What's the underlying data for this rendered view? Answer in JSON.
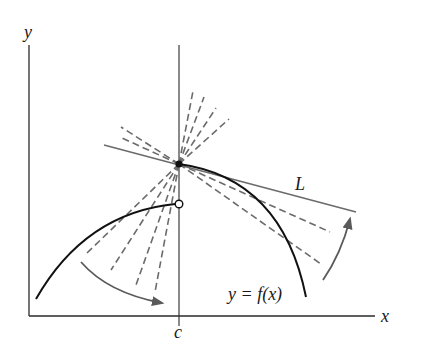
{
  "diagram": {
    "colors": {
      "background": "#ffffff",
      "axis": "#2a2a2a",
      "curve": "#111111",
      "tangent_line": "#6b6b6b",
      "dashed_secants": "#6b6b6b",
      "arrows": "#5a5a5a"
    },
    "labels": {
      "y_axis": "y",
      "x_axis": "x",
      "c_tick": "c",
      "tangent": "L",
      "function": "y = f(x)"
    },
    "points": {
      "filled": {
        "label": "(c, f(c))",
        "x": 179,
        "y": 164
      },
      "open": {
        "label": "left-hand limit (hole)",
        "x": 179,
        "y": 204
      }
    },
    "curves": {
      "left_branch": "M36,299 Q85,213 179,204",
      "right_branch": "M179,164 Q282,178 306,297"
    },
    "tangent_line_L": {
      "x1": 104,
      "y1": 145,
      "x2": 356,
      "y2": 212
    },
    "secants_left_upper": [
      {
        "x1": 179,
        "y1": 164,
        "x2": 121,
        "y2": 127
      },
      {
        "x1": 179,
        "y1": 164,
        "x2": 122,
        "y2": 138
      }
    ],
    "secants_upper_right": [
      {
        "x1": 179,
        "y1": 164,
        "x2": 193,
        "y2": 91
      },
      {
        "x1": 179,
        "y1": 164,
        "x2": 204,
        "y2": 97
      },
      {
        "x1": 179,
        "y1": 164,
        "x2": 216,
        "y2": 108
      },
      {
        "x1": 179,
        "y1": 164,
        "x2": 229,
        "y2": 119
      }
    ],
    "secants_lower_left": [
      {
        "x1": 179,
        "y1": 164,
        "x2": 87,
        "y2": 253
      },
      {
        "x1": 179,
        "y1": 164,
        "x2": 111,
        "y2": 270
      },
      {
        "x1": 179,
        "y1": 164,
        "x2": 136,
        "y2": 285
      },
      {
        "x1": 179,
        "y1": 164,
        "x2": 155,
        "y2": 292
      }
    ],
    "secants_right_lower": [
      {
        "x1": 179,
        "y1": 164,
        "x2": 330,
        "y2": 232
      },
      {
        "x1": 179,
        "y1": 164,
        "x2": 321,
        "y2": 264
      }
    ],
    "arrows": {
      "left": {
        "path": "M81,262 Q108,293 162,303",
        "direction": "clockwise toward secant steepening"
      },
      "right": {
        "path": "M323,280 Q341,254 350,219",
        "direction": "counterclockwise toward tangent L"
      }
    }
  }
}
